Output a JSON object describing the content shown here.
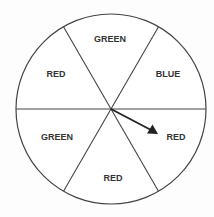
{
  "spinner": {
    "title": "Spinner",
    "sections": [
      {
        "label": "GREEN",
        "position": "top"
      },
      {
        "label": "BLUE",
        "position": "upper-right"
      },
      {
        "label": "RED",
        "position": "lower-right"
      },
      {
        "label": "RED",
        "position": "bottom"
      },
      {
        "label": "GREEN",
        "position": "lower-left"
      },
      {
        "label": "RED",
        "position": "upper-left"
      }
    ],
    "section_count": 6,
    "arrow_points_to": "RED",
    "arrow_points_to_position": "lower-right"
  }
}
